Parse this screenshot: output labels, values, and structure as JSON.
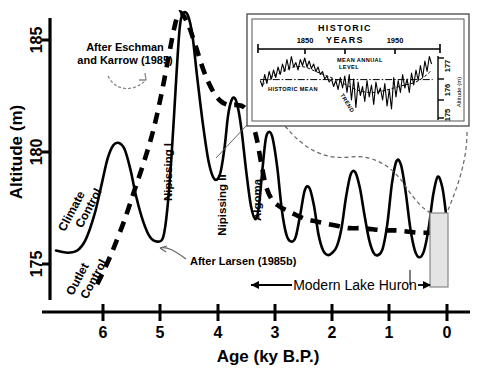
{
  "figure": {
    "title_visible": false,
    "axes": {
      "y_label": "Altitude (m)",
      "y_ticks": [
        175,
        180,
        185
      ],
      "y_range": [
        173.1,
        186.9
      ],
      "x_label": "Age (ky B.P.)",
      "x_ticks": [
        6,
        5,
        4,
        3,
        2,
        1,
        0
      ],
      "x_range": [
        6.82,
        -0.18
      ]
    },
    "annotations": {
      "eschman": "After Eschman\nand Karrow (1985)",
      "eschman_line1": "After Eschman",
      "eschman_line2": "and Karrow (1985)",
      "larsen": "After Larsen (1985b)",
      "climate_control": "Climate\nControl",
      "climate_control_line1": "Climate",
      "climate_control_line2": "Control",
      "outlet_control_line1": "Outlet",
      "outlet_control_line2": "Control",
      "modern_lake": "Modern Lake Huron"
    },
    "phases": [
      {
        "name": "Nipissing I",
        "age_ky": 4.68,
        "altitude_m": 186.2
      },
      {
        "name": "Nipissing II",
        "age_ky": 3.72,
        "altitude_m": 182.4
      },
      {
        "name": "Algoma",
        "age_ky": 3.14,
        "altitude_m": 180.9
      }
    ],
    "colors": {
      "curve": "#000000",
      "dashed": "#000000",
      "box_fill": "#e2e2e2",
      "box_stroke": "#7a7a7a",
      "leader": "#777777"
    }
  },
  "inset": {
    "title_line1": "HISTORIC",
    "title_line2": "YEARS",
    "x_ticks": [
      1850,
      1950
    ],
    "y_ticks": [
      177,
      176,
      175
    ],
    "y_label": "Altitude (m)",
    "labels": {
      "mean_annual_line1": "MEAN ANNUAL",
      "mean_annual_line2": "LEVEL",
      "historic_mean": "HISTORIC MEAN",
      "trend": "TREND"
    }
  },
  "chart_data": {
    "type": "line",
    "xlabel": "Age (ky B.P.)",
    "ylabel": "Altitude (m)",
    "xlim": [
      6.82,
      -0.18
    ],
    "ylim": [
      173.1,
      186.9
    ],
    "xticks": [
      6,
      5,
      4,
      3,
      2,
      1,
      0
    ],
    "yticks": [
      175,
      180,
      185
    ],
    "grid": false,
    "legend": "none",
    "series": [
      {
        "name": "Lake level record (Larsen 1985b, solid)",
        "style": "solid",
        "x": [
          6.82,
          6.62,
          6.45,
          6.3,
          6.15,
          6.02,
          5.92,
          5.82,
          5.72,
          5.62,
          5.52,
          5.42,
          5.3,
          5.18,
          5.05,
          4.95,
          4.88,
          4.8,
          4.72,
          4.66,
          4.6,
          4.52,
          4.44,
          4.36,
          4.26,
          4.16,
          4.06,
          3.96,
          3.88,
          3.82,
          3.76,
          3.7,
          3.64,
          3.58,
          3.5,
          3.42,
          3.34,
          3.28,
          3.22,
          3.16,
          3.1,
          3.04,
          2.96,
          2.88,
          2.8,
          2.72,
          2.64,
          2.56,
          2.48,
          2.4,
          2.32,
          2.24,
          2.16,
          2.08,
          2.0,
          1.92,
          1.84,
          1.76,
          1.68,
          1.6,
          1.52,
          1.44,
          1.36,
          1.28,
          1.2,
          1.12,
          1.04,
          0.96,
          0.88,
          0.8,
          0.72,
          0.64,
          0.56,
          0.48,
          0.4,
          0.32,
          0.24,
          0.16,
          0.08,
          0.02
        ],
        "y": [
          175.6,
          175.5,
          175.6,
          176.1,
          177.2,
          178.6,
          179.7,
          180.3,
          180.4,
          180.1,
          179.2,
          178.0,
          176.9,
          176.2,
          176.0,
          176.2,
          177.4,
          180.0,
          183.4,
          185.6,
          186.2,
          186.1,
          185.2,
          183.4,
          181.3,
          179.6,
          178.8,
          179.0,
          180.2,
          181.6,
          182.3,
          182.4,
          181.9,
          180.9,
          179.1,
          177.6,
          177.0,
          177.6,
          179.2,
          180.6,
          180.9,
          180.6,
          179.3,
          177.4,
          176.3,
          176.0,
          176.2,
          177.2,
          178.3,
          178.4,
          177.6,
          176.3,
          175.6,
          175.4,
          175.5,
          175.8,
          176.6,
          178.0,
          179.0,
          179.1,
          178.4,
          177.2,
          176.1,
          175.5,
          175.4,
          175.7,
          176.8,
          178.6,
          179.6,
          179.4,
          178.2,
          176.6,
          175.6,
          175.3,
          175.6,
          176.6,
          178.1,
          178.9,
          178.4,
          177.3
        ]
      },
      {
        "name": "Eschman and Karrow 1985 (dashed)",
        "style": "dashed",
        "x": [
          6.1,
          5.95,
          5.8,
          5.62,
          5.45,
          5.28,
          5.12,
          4.98,
          4.86,
          4.76,
          4.68,
          4.6,
          4.5,
          4.38,
          4.24,
          4.1,
          3.96,
          3.82,
          3.68,
          3.54,
          3.42,
          3.32,
          3.24,
          3.16,
          3.06,
          2.94,
          2.8,
          2.64,
          2.46,
          2.28,
          2.1,
          1.9,
          1.7,
          1.5,
          1.3,
          1.1,
          0.9,
          0.7,
          0.5,
          0.3,
          0.12
        ],
        "y": [
          174.1,
          174.9,
          175.8,
          177.0,
          178.3,
          179.6,
          181.0,
          182.6,
          184.2,
          185.5,
          186.2,
          186.1,
          185.6,
          184.7,
          183.6,
          182.8,
          182.3,
          182.1,
          182.1,
          182.0,
          181.5,
          180.6,
          179.5,
          178.5,
          177.9,
          177.6,
          177.4,
          177.2,
          177.0,
          176.9,
          176.8,
          176.7,
          176.6,
          176.6,
          176.55,
          176.5,
          176.5,
          176.45,
          176.4,
          176.4,
          176.4
        ]
      }
    ],
    "inset_chart": {
      "type": "line",
      "title": "HISTORIC YEARS",
      "xlabel": "",
      "ylabel": "Altitude (m)",
      "xticks": [
        1850,
        1950
      ],
      "yticks": [
        175,
        176,
        177
      ],
      "xlim": [
        1818,
        1978
      ],
      "ylim": [
        174.8,
        177.35
      ],
      "series": [
        {
          "name": "MEAN ANNUAL LEVEL",
          "style": "solid",
          "x": [
            1820,
            1822,
            1824,
            1826,
            1828,
            1830,
            1832,
            1834,
            1836,
            1838,
            1840,
            1842,
            1844,
            1846,
            1848,
            1850,
            1852,
            1854,
            1856,
            1858,
            1860,
            1862,
            1864,
            1866,
            1868,
            1870,
            1872,
            1874,
            1876,
            1878,
            1880,
            1882,
            1884,
            1886,
            1888,
            1890,
            1892,
            1894,
            1896,
            1898,
            1900,
            1902,
            1904,
            1906,
            1908,
            1910,
            1912,
            1914,
            1916,
            1918,
            1920,
            1922,
            1924,
            1926,
            1928,
            1930,
            1932,
            1934,
            1936,
            1938,
            1940,
            1942,
            1944,
            1946,
            1948,
            1950,
            1952,
            1954,
            1956,
            1958,
            1960,
            1962,
            1964,
            1966,
            1968,
            1970,
            1972,
            1974
          ],
          "y": [
            176.25,
            176.05,
            176.45,
            176.15,
            176.55,
            176.3,
            176.6,
            176.35,
            176.7,
            176.45,
            176.8,
            176.55,
            176.95,
            176.6,
            177.05,
            176.7,
            176.85,
            176.6,
            176.95,
            176.75,
            177.0,
            176.7,
            176.9,
            176.65,
            176.8,
            176.55,
            176.7,
            176.45,
            176.55,
            176.3,
            176.4,
            176.2,
            176.3,
            176.05,
            176.25,
            175.95,
            176.35,
            176.0,
            176.4,
            175.85,
            176.45,
            175.6,
            176.3,
            175.35,
            176.2,
            175.75,
            176.05,
            175.55,
            176.25,
            175.7,
            176.1,
            175.45,
            176.2,
            175.8,
            176.0,
            175.6,
            176.15,
            175.4,
            175.95,
            175.3,
            176.35,
            175.7,
            176.25,
            175.85,
            176.45,
            176.0,
            176.3,
            175.85,
            176.5,
            176.1,
            176.6,
            176.25,
            176.75,
            176.35,
            176.9,
            176.55,
            177.05,
            176.8
          ]
        },
        {
          "name": "TREND",
          "style": "dashed",
          "x": [
            1822,
            1830,
            1840,
            1850,
            1860,
            1870,
            1880,
            1890,
            1900,
            1910,
            1920,
            1930,
            1940,
            1950,
            1960,
            1970,
            1974
          ],
          "y": [
            176.1,
            176.35,
            176.55,
            176.7,
            176.7,
            176.55,
            176.4,
            176.25,
            176.05,
            175.9,
            175.85,
            175.9,
            176.0,
            176.1,
            176.2,
            176.45,
            176.6
          ]
        },
        {
          "name": "HISTORIC MEAN",
          "style": "dashdot",
          "x": [
            1820,
            1975
          ],
          "y": [
            176.28,
            176.28
          ]
        }
      ]
    }
  }
}
